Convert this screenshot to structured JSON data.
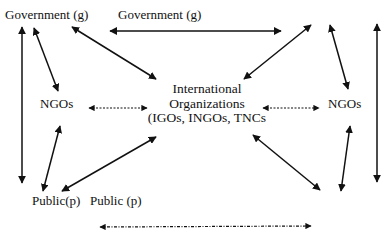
{
  "diagram": {
    "nodes": {
      "gov_left": {
        "label": "Government (g)"
      },
      "gov_top": {
        "label": "Government (g)"
      },
      "ngos_left": {
        "label": "NGOs"
      },
      "ngos_right": {
        "label": "NGOs"
      },
      "center": {
        "lines": [
          "International",
          "Organizations",
          "(IGOs, INGOs, TNCs"
        ]
      },
      "public_left": {
        "label": "Public(p)"
      },
      "public_mid": {
        "label": "Public (p)"
      }
    },
    "edges": [
      {
        "id": "gov-left-to-gov-right",
        "from": "gov_top",
        "to": "gov_right",
        "style": "solid",
        "direction": "both"
      },
      {
        "id": "gov-left-to-public-left-vertical",
        "from": "gov_left",
        "to": "public_left",
        "style": "solid",
        "direction": "both"
      },
      {
        "id": "gov-right-to-public-right-vertical",
        "from": "gov_right",
        "to": "public_right",
        "style": "solid",
        "direction": "both"
      },
      {
        "id": "gov-left-to-ngos-left",
        "from": "gov_left",
        "to": "ngos_left",
        "style": "solid",
        "direction": "both"
      },
      {
        "id": "gov-left-to-center",
        "from": "gov_left",
        "to": "center",
        "style": "solid",
        "direction": "both"
      },
      {
        "id": "center-to-gov-right",
        "from": "center",
        "to": "gov_right",
        "style": "solid",
        "direction": "both"
      },
      {
        "id": "gov-right-to-ngos-right",
        "from": "gov_right",
        "to": "ngos_right",
        "style": "solid",
        "direction": "both"
      },
      {
        "id": "ngos-left-to-center",
        "from": "ngos_left",
        "to": "center",
        "style": "dashed",
        "direction": "both"
      },
      {
        "id": "center-to-ngos-right",
        "from": "center",
        "to": "ngos_right",
        "style": "dashed",
        "direction": "both"
      },
      {
        "id": "ngos-left-to-public-left",
        "from": "ngos_left",
        "to": "public_left",
        "style": "solid",
        "direction": "both"
      },
      {
        "id": "center-to-public-left",
        "from": "center",
        "to": "public_left",
        "style": "solid",
        "direction": "both"
      },
      {
        "id": "center-to-public-right",
        "from": "center",
        "to": "public_right",
        "style": "solid",
        "direction": "both"
      },
      {
        "id": "ngos-right-to-public-right",
        "from": "ngos_right",
        "to": "public_right",
        "style": "solid",
        "direction": "both"
      },
      {
        "id": "public-left-to-public-right",
        "from": "public_mid",
        "to": "public_right",
        "style": "dash-dot",
        "direction": "both"
      }
    ],
    "colors": {
      "ink": "#111111",
      "background": "#ffffff"
    }
  }
}
